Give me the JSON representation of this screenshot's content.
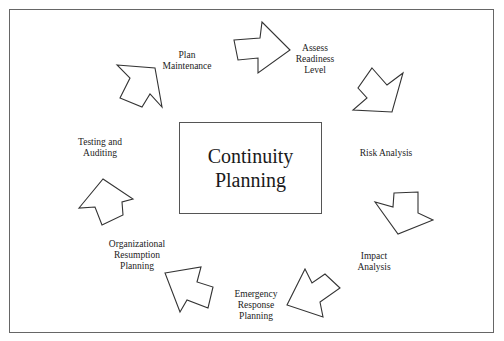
{
  "diagram": {
    "type": "cycle",
    "center": {
      "label": "Continuity\nPlanning"
    },
    "steps": [
      {
        "label": "Assess\nReadiness\nLevel",
        "x": 315,
        "y": 44
      },
      {
        "label": "Risk Analysis",
        "x": 386,
        "y": 148
      },
      {
        "label": "Impact\nAnalysis",
        "x": 375,
        "y": 250
      },
      {
        "label": "Emergency\nResponse\nPlanning",
        "x": 256,
        "y": 290
      },
      {
        "label": "Organizational\nResumption\nPlanning",
        "x": 137,
        "y": 240
      },
      {
        "label": "Testing and\nAuditing",
        "x": 99,
        "y": 138
      },
      {
        "label": "Plan\nMaintenance",
        "x": 187,
        "y": 50
      }
    ],
    "arrows": [
      {
        "name": "arrow-to-assess-readiness",
        "points": "234,40 260,38 262,22 290,50 258,73 258,58 238,60"
      },
      {
        "name": "arrow-to-risk-analysis",
        "points": "372,68 387,85 403,73 392,112 353,110 367,98 358,88"
      },
      {
        "name": "arrow-to-impact-analysis",
        "points": "394,193 418,192 418,213 433,220 398,234 375,202 393,207"
      },
      {
        "name": "arrow-to-emergency-response",
        "points": "305,269 312,283 325,274 340,288 320,302 323,317 287,305"
      },
      {
        "name": "arrow-to-organizational-resumption",
        "points": "165,273 201,267 197,282 213,287 208,308 187,300 180,312"
      },
      {
        "name": "arrow-to-testing-auditing",
        "points": "103,179 133,199 122,202 123,215 102,225 95,207 79,208"
      },
      {
        "name": "arrow-to-plan-maintenance",
        "points": "117,65 155,68 162,107 150,94 142,107 120,98 130,78"
      }
    ]
  }
}
